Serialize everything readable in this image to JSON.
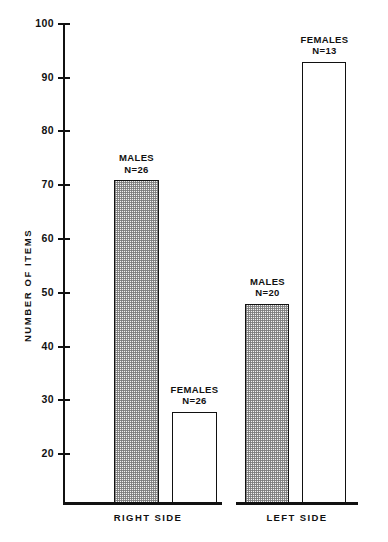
{
  "chart_data": {
    "type": "bar",
    "title": "",
    "subtitle": "",
    "xlabel": "",
    "ylabel": "NUMBER OF ITEMS",
    "ylim": [
      11,
      100
    ],
    "yticks": [
      20,
      30,
      40,
      50,
      60,
      70,
      80,
      90,
      100
    ],
    "ytick_labels": [
      "20",
      "30",
      "40",
      "50",
      "60",
      "70",
      "80",
      "90",
      "100"
    ],
    "grid": false,
    "legend": "none",
    "axis_note": "y-axis baseline is truncated; the drawn baseline sits near value 11, not 0",
    "groups": [
      "RIGHT SIDE",
      "LEFT SIDE"
    ],
    "categories": [
      "MALES",
      "FEMALES",
      "MALES",
      "FEMALES"
    ],
    "values": [
      71,
      28,
      48,
      93
    ],
    "bars": [
      {
        "group": "RIGHT SIDE",
        "label": "MALES",
        "n_label": "N=26",
        "n": 26,
        "value": 71,
        "fill": "shaded"
      },
      {
        "group": "RIGHT SIDE",
        "label": "FEMALES",
        "n_label": "N=26",
        "n": 26,
        "value": 28,
        "fill": "open"
      },
      {
        "group": "LEFT SIDE",
        "label": "MALES",
        "n_label": "N=20",
        "n": 20,
        "value": 48,
        "fill": "shaded"
      },
      {
        "group": "LEFT SIDE",
        "label": "FEMALES",
        "n_label": "N=13",
        "n": 13,
        "value": 93,
        "fill": "open"
      }
    ],
    "colors": {
      "ink": "#111111",
      "background": "#ffffff",
      "shaded_fill": "#f2f2f2",
      "open_fill": "#ffffff"
    }
  },
  "axis": {
    "ticks": [
      {
        "label": "100"
      },
      {
        "label": "90"
      },
      {
        "label": "80"
      },
      {
        "label": "70"
      },
      {
        "label": "60"
      },
      {
        "label": "50"
      },
      {
        "label": "40"
      },
      {
        "label": "30"
      },
      {
        "label": "20"
      }
    ],
    "y_title": "NUMBER OF ITEMS"
  },
  "groups": [
    {
      "label": "RIGHT SIDE"
    },
    {
      "label": "LEFT SIDE"
    }
  ],
  "bar_captions": [
    {
      "name": "MALES",
      "n": "N=26"
    },
    {
      "name": "FEMALES",
      "n": "N=26"
    },
    {
      "name": "MALES",
      "n": "N=20"
    },
    {
      "name": "FEMALES",
      "n": "N=13"
    }
  ]
}
